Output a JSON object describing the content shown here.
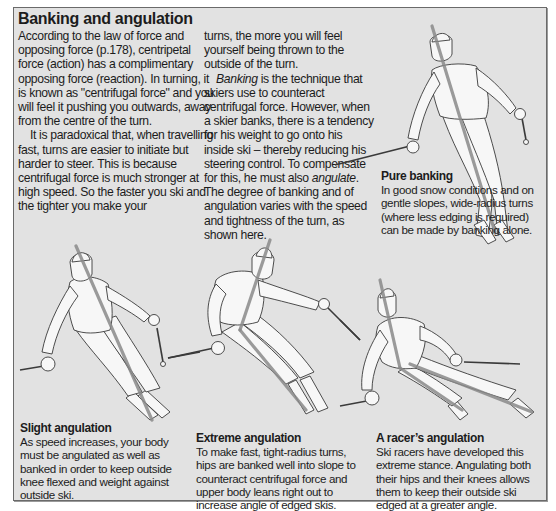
{
  "article": {
    "title": "Banking and angulation",
    "column1": {
      "para1": "According to the law of force and opposing force (p.178), centripetal force (action) has a complimentary opposing force (reaction). In turning, it is known as \"centrifugal force\" and you will feel it pushing you outwards, away from the centre of the turn.",
      "para2": "It is paradoxical that, when travelling fast, turns are easier to initiate but harder to steer. This is because centrifugal force is much stronger at high speed. So the faster you ski and the tighter you make your"
    },
    "column2": {
      "para1": "turns, the more you will feel yourself being thrown to the outside of the turn.",
      "para2_italic_lead": "Banking",
      "para2_a": " is the technique that skiers use to counteract centrifugal force. However, when a skier banks, there is a tendency for his weight to go onto his inside ski – thereby reducing his steering control. To compensate for this, he must also ",
      "para2_italic_mid": "angulate",
      "para2_b": ". The degree of banking and of angulation varies with the speed and tightness of the turn, as shown here."
    }
  },
  "figures": [
    {
      "id": "pure-banking",
      "title": "Pure banking",
      "caption": "In good snow conditions and on gentle slopes, wide-radius turns (where less edging is required) can be made by banking alone."
    },
    {
      "id": "slight-angulation",
      "title": "Slight angulation",
      "caption": "As speed increases, your body must be angulated as well as banked in order to keep outside knee flexed and weight against outside ski."
    },
    {
      "id": "extreme-angulation",
      "title": "Extreme angulation",
      "caption": "To make fast, tight-radius turns, hips are banked well into slope to counteract centrifugal force and upper body leans right out to increase angle of edged skis."
    },
    {
      "id": "racers-angulation",
      "title": "A racer’s angulation",
      "caption": "Ski racers have developed this extreme stance. Angulating both their hips and their knees allows them to keep their outside ski edged at a greater angle."
    }
  ],
  "colors": {
    "panel_background": "#e2e2e2",
    "panel_border": "#6a6a6a",
    "body_axis_line": "#8a8a8a",
    "text": "#1c1c1c"
  }
}
